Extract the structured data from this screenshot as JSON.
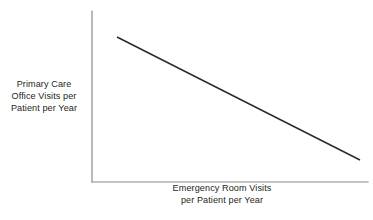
{
  "chart_data": {
    "type": "line",
    "title": "",
    "subtitle": "",
    "xlabel": "Emergency Room Visits\nper Patient per Year",
    "ylabel": "Primary Care\nOffice Visits per\nPatient per Year",
    "xlabel_lines": [
      "Emergency Room Visits",
      "per Patient per Year"
    ],
    "ylabel_lines": [
      "Primary Care",
      "Office Visits per",
      "Patient per Year"
    ],
    "x": [
      0.09,
      1.0
    ],
    "series": [
      {
        "name": "Primary care visits vs emergency room visits",
        "values": [
          0.85,
          0.13
        ],
        "relationship": "negative linear",
        "color": "#2b2b2b"
      }
    ],
    "xlim": [
      0,
      1
    ],
    "ylim": [
      0,
      1
    ],
    "xticks": [],
    "yticks": [],
    "xticklabels": [],
    "yticklabels": [],
    "grid": false,
    "legend": false,
    "legend_position": "none",
    "annotations": [],
    "axis_style": "left-and-bottom-spines-only",
    "axis_color": "#8a8a8a",
    "background_color": "#ffffff",
    "text_color": "#231f20"
  },
  "geometry": {
    "axis_x_position": 92,
    "axis_y_top": 11,
    "axis_y_bottom": 182,
    "axis_x_right": 368,
    "line_start": {
      "x": 117,
      "y": 37
    },
    "line_end": {
      "x": 360,
      "y": 160
    },
    "line_width": 1.5,
    "axis_width": 1.2
  }
}
